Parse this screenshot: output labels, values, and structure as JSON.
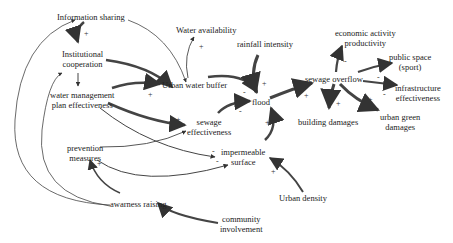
{
  "diagram": {
    "type": "causal-loop-diagram",
    "nodes": {
      "information_sharing": "Information sharing",
      "institutional_cooperation_1": "Institutional",
      "institutional_cooperation_2": "cooperation",
      "water_mgmt_1": "water management",
      "water_mgmt_2": "plan effectiveness",
      "water_availability": "Water availability",
      "urban_water_buffer": "Urban water buffer",
      "rainfall_intensity": "rainfall intensity",
      "flood": "flood",
      "sewage_effectiveness_1": "sewage",
      "sewage_effectiveness_2": "effectiveness",
      "prevention_measures_1": "prevention",
      "prevention_measures_2": "measures",
      "impermeable_surface_1": "impermeable",
      "impermeable_surface_2": "surface",
      "urban_density": "Urban density",
      "awarness_raising": "awarness raising",
      "community_involvement_1": "community",
      "community_involvement_2": "involvement",
      "sewage_overflow": "sewage overflow",
      "economic_activity_1": "economic activity",
      "economic_activity_2": "productivity",
      "public_space_1": "public space",
      "public_space_2": "(sport)",
      "infrastructure_1": "infrastructure",
      "infrastructure_2": "effectiveness",
      "building_damages": "building damages",
      "urban_green_1": "urban green",
      "urban_green_2": "damages"
    },
    "signs": {
      "plus": "+",
      "minus": "-"
    },
    "links": [
      {
        "from": "Information sharing",
        "to": "Institutional cooperation",
        "polarity": "+"
      },
      {
        "from": "Institutional cooperation",
        "to": "water management plan effectiveness",
        "polarity": "+"
      },
      {
        "from": "Institutional cooperation",
        "to": "Urban water buffer",
        "polarity": "+"
      },
      {
        "from": "Information sharing",
        "to": "Urban water buffer",
        "polarity": "+"
      },
      {
        "from": "water management plan effectiveness",
        "to": "Urban water buffer",
        "polarity": "+"
      },
      {
        "from": "Urban water buffer",
        "to": "Water availability",
        "polarity": "+"
      },
      {
        "from": "Urban water buffer",
        "to": "flood",
        "polarity": "-"
      },
      {
        "from": "rainfall intensity",
        "to": "flood",
        "polarity": "+"
      },
      {
        "from": "sewage effectiveness",
        "to": "flood",
        "polarity": "-"
      },
      {
        "from": "impermeable surface",
        "to": "flood",
        "polarity": "+"
      },
      {
        "from": "water management plan effectiveness",
        "to": "sewage effectiveness",
        "polarity": "+"
      },
      {
        "from": "prevention measures",
        "to": "sewage effectiveness",
        "polarity": "+"
      },
      {
        "from": "water management plan effectiveness",
        "to": "impermeable surface",
        "polarity": "-"
      },
      {
        "from": "prevention measures",
        "to": "impermeable surface",
        "polarity": "-"
      },
      {
        "from": "Urban density",
        "to": "impermeable surface",
        "polarity": "+"
      },
      {
        "from": "awarness raising",
        "to": "prevention measures",
        "polarity": "+"
      },
      {
        "from": "awarness raising",
        "to": "Information sharing",
        "polarity": "+"
      },
      {
        "from": "awarness raising",
        "to": "Institutional cooperation",
        "polarity": "+"
      },
      {
        "from": "community involvement",
        "to": "awarness raising",
        "polarity": "+"
      },
      {
        "from": "flood",
        "to": "sewage overflow",
        "polarity": "+"
      },
      {
        "from": "sewage overflow",
        "to": "economic activity productivity",
        "polarity": "-"
      },
      {
        "from": "sewage overflow",
        "to": "public space (sport)",
        "polarity": "-"
      },
      {
        "from": "sewage overflow",
        "to": "infrastructure effectiveness",
        "polarity": "-"
      },
      {
        "from": "sewage overflow",
        "to": "building damages",
        "polarity": "+"
      },
      {
        "from": "sewage overflow",
        "to": "urban green damages",
        "polarity": "+"
      }
    ]
  }
}
